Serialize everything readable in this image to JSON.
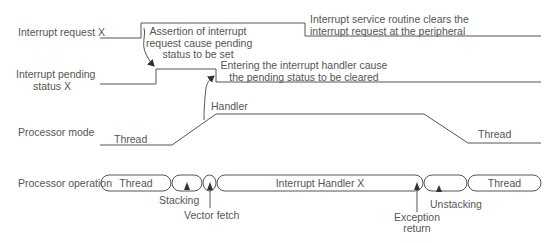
{
  "signals": {
    "interrupt_request": "Interrupt request X",
    "pending_status_line1": "Interrupt pending",
    "pending_status_line2": "status X",
    "processor_mode": "Processor mode",
    "processor_operation": "Processor operation"
  },
  "annotations": {
    "assertion_line1": "Assertion of interrupt",
    "assertion_line2": "request cause pending",
    "assertion_line3": "status to be set",
    "isr_clears_line1": "Interrupt service routine clears the",
    "isr_clears_line2": "interrupt request at the peripheral",
    "entering_line1": "Entering the interrupt handler cause",
    "entering_line2": "the pending status to be cleared",
    "handler_mode": "Handler",
    "thread_mode_left": "Thread",
    "thread_mode_right": "Thread"
  },
  "operation": {
    "segments": [
      {
        "label": "Thread"
      },
      {
        "label": ""
      },
      {
        "label": ""
      },
      {
        "label": "Interrupt Handler X"
      },
      {
        "label": ""
      },
      {
        "label": "Thread"
      }
    ],
    "markers": {
      "stacking": "Stacking",
      "vector_fetch": "Vector fetch",
      "exception_return_line1": "Exception",
      "exception_return_line2": "return",
      "unstacking": "Unstacking"
    }
  },
  "colors": {
    "line": "#555555",
    "text": "#555555",
    "background": "#ffffff"
  }
}
